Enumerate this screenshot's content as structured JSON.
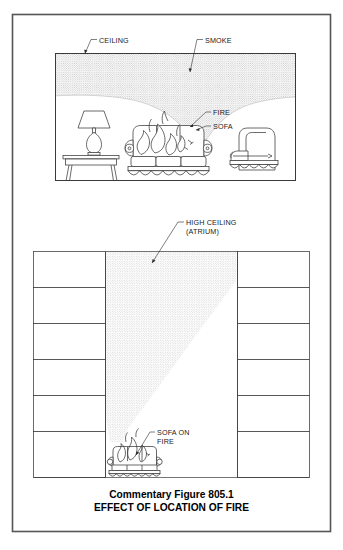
{
  "figure": {
    "caption_line1": "Commentary Figure 805.1",
    "caption_line2": "EFFECT OF LOCATION OF FIRE",
    "frame_color": "#444444",
    "smoke_color": "#d8d8d8",
    "line_color": "#3a3a3a"
  },
  "panel_top": {
    "name": "normal-ceiling-room",
    "labels": {
      "ceiling": "CEILING",
      "smoke": "SMOKE",
      "fire": "FIRE",
      "sofa": "SOFA"
    },
    "objects": [
      "side-table",
      "table-lamp",
      "sofa",
      "flames",
      "armchair"
    ],
    "description": "Room with normal ceiling height; smoke layer banks down under ceiling"
  },
  "panel_bottom": {
    "name": "atrium-section",
    "labels": {
      "high_ceiling_line1": "HIGH CEILING",
      "high_ceiling_line2": "(ATRIUM)",
      "sofa_on_fire_line1": "SOFA ON",
      "sofa_on_fire_line2": "FIRE"
    },
    "floor_count": 6,
    "objects": [
      "floor-slabs-left",
      "floor-slabs-right",
      "smoke-plume",
      "burning-sofa"
    ],
    "description": "Multi-story atrium section; smoke plume rises and widens toward high ceiling"
  }
}
